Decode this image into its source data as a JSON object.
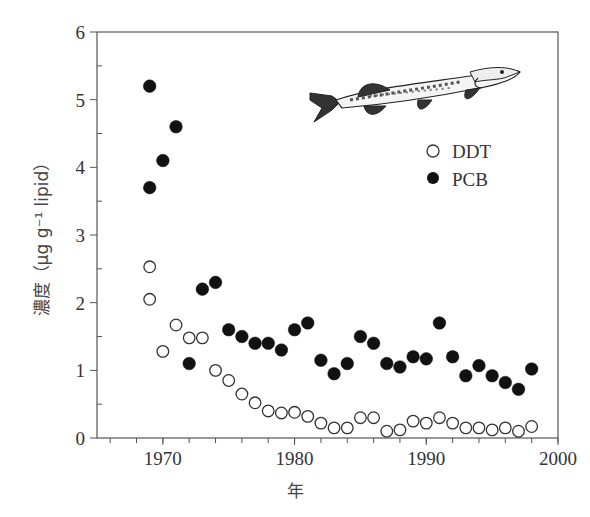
{
  "chart_data": {
    "type": "scatter",
    "title": "",
    "xlabel": "年",
    "ylabel": "濃度（μg g⁻¹ lipid）",
    "xlim": [
      1965,
      2000
    ],
    "ylim": [
      0,
      6
    ],
    "xticks": [
      1970,
      1980,
      1990,
      2000
    ],
    "yticks": [
      0,
      1,
      2,
      3,
      4,
      5,
      6
    ],
    "grid": false,
    "legend_position": "upper right (below fish illustration)",
    "annotations": [
      "pike fish illustration (top right)"
    ],
    "series": [
      {
        "name": "DDT",
        "marker": "open-circle",
        "points": [
          [
            1969,
            2.53
          ],
          [
            1969,
            2.05
          ],
          [
            1970,
            1.28
          ],
          [
            1971,
            1.67
          ],
          [
            1972,
            1.48
          ],
          [
            1973,
            1.48
          ],
          [
            1974,
            1.0
          ],
          [
            1975,
            0.85
          ],
          [
            1976,
            0.65
          ],
          [
            1977,
            0.52
          ],
          [
            1978,
            0.4
          ],
          [
            1979,
            0.37
          ],
          [
            1980,
            0.38
          ],
          [
            1981,
            0.32
          ],
          [
            1982,
            0.22
          ],
          [
            1983,
            0.15
          ],
          [
            1984,
            0.15
          ],
          [
            1985,
            0.3
          ],
          [
            1986,
            0.3
          ],
          [
            1987,
            0.1
          ],
          [
            1988,
            0.12
          ],
          [
            1989,
            0.25
          ],
          [
            1990,
            0.22
          ],
          [
            1991,
            0.3
          ],
          [
            1992,
            0.22
          ],
          [
            1993,
            0.15
          ],
          [
            1994,
            0.15
          ],
          [
            1995,
            0.12
          ],
          [
            1996,
            0.15
          ],
          [
            1997,
            0.1
          ],
          [
            1998,
            0.17
          ]
        ]
      },
      {
        "name": "PCB",
        "marker": "filled-circle",
        "points": [
          [
            1969,
            5.2
          ],
          [
            1969,
            3.7
          ],
          [
            1970,
            4.1
          ],
          [
            1971,
            4.6
          ],
          [
            1972,
            1.1
          ],
          [
            1973,
            2.2
          ],
          [
            1974,
            2.3
          ],
          [
            1975,
            1.6
          ],
          [
            1976,
            1.5
          ],
          [
            1977,
            1.4
          ],
          [
            1978,
            1.4
          ],
          [
            1979,
            1.3
          ],
          [
            1980,
            1.6
          ],
          [
            1981,
            1.7
          ],
          [
            1982,
            1.15
          ],
          [
            1983,
            0.95
          ],
          [
            1984,
            1.1
          ],
          [
            1985,
            1.5
          ],
          [
            1986,
            1.4
          ],
          [
            1987,
            1.1
          ],
          [
            1988,
            1.05
          ],
          [
            1989,
            1.2
          ],
          [
            1990,
            1.17
          ],
          [
            1991,
            1.7
          ],
          [
            1992,
            1.2
          ],
          [
            1993,
            0.92
          ],
          [
            1994,
            1.07
          ],
          [
            1995,
            0.92
          ],
          [
            1996,
            0.82
          ],
          [
            1997,
            0.72
          ],
          [
            1998,
            1.02
          ]
        ]
      }
    ]
  },
  "labels": {
    "x_axis": "年",
    "y_axis": "濃度（μg g⁻¹ lipid）",
    "legend_ddt": "DDT",
    "legend_pcb": "PCB"
  },
  "colors": {
    "axis": "#555555",
    "marker_fill": "#111111",
    "text": "#333333"
  }
}
